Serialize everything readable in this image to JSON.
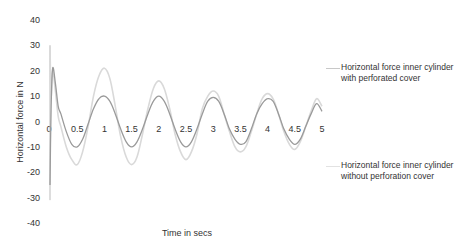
{
  "chart_data": {
    "type": "line",
    "title": "",
    "xlabel": "Time in secs",
    "ylabel": "Horizontal force in N",
    "xlim": [
      0,
      5
    ],
    "ylim": [
      -40,
      40
    ],
    "xticks": [
      "0",
      "0.5",
      "1",
      "1.5",
      "2",
      "2.5",
      "3",
      "3.5",
      "4",
      "4.5",
      "5"
    ],
    "yticks": [
      "40",
      "30",
      "20",
      "10",
      "0",
      "-10",
      "-20",
      "-30",
      "-40"
    ],
    "grid": false,
    "legend_position": "right",
    "x": [
      0.0,
      0.02,
      0.05,
      0.1,
      0.15,
      0.2,
      0.3,
      0.4,
      0.5,
      0.6,
      0.7,
      0.8,
      0.9,
      1.0,
      1.1,
      1.2,
      1.3,
      1.4,
      1.5,
      1.6,
      1.7,
      1.8,
      1.9,
      2.0,
      2.1,
      2.2,
      2.3,
      2.4,
      2.5,
      2.6,
      2.7,
      2.8,
      2.9,
      3.0,
      3.1,
      3.2,
      3.3,
      3.4,
      3.5,
      3.6,
      3.7,
      3.8,
      3.9,
      4.0,
      4.1,
      4.2,
      4.3,
      4.4,
      4.5,
      4.6,
      4.7,
      4.8,
      4.9,
      5.0
    ],
    "series": [
      {
        "name": "Horizontal force inner cylinder with perforated cover",
        "color": "#9a9a9a",
        "values": [
          -25,
          5,
          21,
          15,
          6,
          3,
          -4,
          -9,
          -10,
          -7,
          -1,
          5,
          9,
          10,
          8,
          3,
          -3,
          -8,
          -10,
          -8,
          -3,
          3,
          8,
          10,
          8,
          3,
          -3,
          -8,
          -10,
          -8,
          -3,
          3,
          8,
          9.5,
          8,
          3,
          -3,
          -7,
          -9,
          -8,
          -3,
          3,
          7,
          9,
          8,
          3,
          -3,
          -7,
          -9,
          -7,
          -2,
          3,
          7,
          4
        ]
      },
      {
        "name": "Horizontal force inner cylinder without perforation cover",
        "color": "#d9d9d9",
        "values": [
          30,
          10,
          20,
          12,
          2,
          -2,
          -10,
          -15,
          -17,
          -12,
          -2,
          10,
          18,
          21,
          17,
          6,
          -6,
          -14,
          -17,
          -14,
          -5,
          5,
          13,
          16,
          13,
          5,
          -5,
          -12,
          -15,
          -12,
          -5,
          5,
          10,
          12,
          10,
          3,
          -4,
          -10,
          -12,
          -10,
          -4,
          3,
          9,
          11,
          9,
          3,
          -4,
          -9,
          -11,
          -8,
          -2,
          4,
          9,
          6
        ]
      }
    ]
  },
  "legend": {
    "items": [
      {
        "label": "Horizontal force inner cylinder with perforated cover",
        "color": "#9a9a9a"
      },
      {
        "label": "Horizontal force inner cylinder without perforation cover",
        "color": "#d9d9d9"
      }
    ]
  }
}
